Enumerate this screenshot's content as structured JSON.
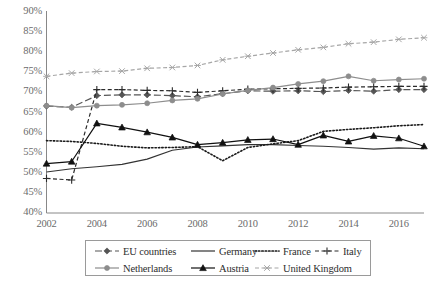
{
  "chart_data": {
    "type": "line",
    "title": "",
    "xlabel": "",
    "ylabel": "",
    "xlim": [
      2002,
      2017
    ],
    "ylim": [
      40,
      90
    ],
    "y_tick_suffix": "%",
    "grid": false,
    "legend_position": "bottom",
    "x": [
      2002,
      2003,
      2004,
      2005,
      2006,
      2007,
      2008,
      2009,
      2010,
      2011,
      2012,
      2013,
      2014,
      2015,
      2016,
      2017
    ],
    "xticks": [
      2002,
      2004,
      2006,
      2008,
      2010,
      2012,
      2014,
      2016
    ],
    "xtick_labels": [
      "2002",
      "2004",
      "2006",
      "2008",
      "2010",
      "2012",
      "2014",
      "2016"
    ],
    "yticks": [
      40,
      45,
      50,
      55,
      60,
      65,
      70,
      75,
      80,
      85,
      90
    ],
    "ytick_labels": [
      "40%",
      "45%",
      "50%",
      "55%",
      "60%",
      "65%",
      "70%",
      "75%",
      "80%",
      "85%",
      "90%"
    ],
    "series": [
      {
        "name": "EU countries",
        "marker": "diamond",
        "dash": "long-dash",
        "color": "#555555",
        "values": [
          66.6,
          66.3,
          69.2,
          69.4,
          69.4,
          69.2,
          68.9,
          69.7,
          70.4,
          70.3,
          70.4,
          70.2,
          70.5,
          70.3,
          70.7,
          70.7
        ]
      },
      {
        "name": "Germany",
        "marker": "none",
        "dash": "solid",
        "color": "#333333",
        "values": [
          50.2,
          51.0,
          51.5,
          52.1,
          53.4,
          55.6,
          56.4,
          56.7,
          57.0,
          57.0,
          56.8,
          56.6,
          56.3,
          55.9,
          56.2,
          56.0
        ]
      },
      {
        "name": "France",
        "marker": "none",
        "dash": "dotted",
        "color": "#1a1a1a",
        "values": [
          58.0,
          57.8,
          57.3,
          56.6,
          56.2,
          56.3,
          56.5,
          53.0,
          56.3,
          57.2,
          58.0,
          60.3,
          60.8,
          61.2,
          61.7,
          62.0
        ]
      },
      {
        "name": "Italy",
        "marker": "plus",
        "dash": "short-dash",
        "color": "#2b2b2b",
        "values": [
          48.6,
          48.2,
          70.7,
          70.7,
          70.5,
          70.4,
          70.0,
          70.4,
          70.8,
          70.9,
          71.0,
          71.1,
          71.3,
          71.4,
          71.5,
          71.5
        ]
      },
      {
        "name": "Netherlands",
        "marker": "circle",
        "dash": "solid",
        "color": "#8d8d8d",
        "values": [
          66.7,
          66.2,
          66.7,
          66.9,
          67.3,
          68.0,
          68.4,
          69.6,
          70.5,
          71.2,
          72.1,
          72.8,
          74.0,
          72.9,
          73.2,
          73.4
        ]
      },
      {
        "name": "Austria",
        "marker": "triangle",
        "dash": "solid",
        "color": "#111111",
        "values": [
          52.3,
          52.8,
          62.3,
          61.3,
          60.1,
          58.8,
          57.0,
          57.5,
          58.2,
          58.4,
          57.0,
          59.3,
          57.8,
          59.2,
          58.6,
          56.6
        ]
      },
      {
        "name": "United Kingdom",
        "marker": "cross",
        "dash": "short-dash",
        "color": "#a6a6a6",
        "values": [
          74.0,
          74.8,
          75.2,
          75.3,
          76.0,
          76.2,
          76.7,
          78.1,
          79.0,
          79.8,
          80.6,
          81.2,
          82.1,
          82.5,
          83.2,
          83.6
        ]
      }
    ]
  },
  "legend": {
    "rows": [
      [
        {
          "label": "EU countries",
          "series": 0
        },
        {
          "label": "Germany",
          "series": 1
        },
        {
          "label": "France",
          "series": 2
        },
        {
          "label": "Italy",
          "series": 3
        }
      ],
      [
        {
          "label": "Netherlands",
          "series": 4
        },
        {
          "label": "Austria",
          "series": 5
        },
        {
          "label": "United Kingdom",
          "series": 6
        }
      ]
    ]
  }
}
